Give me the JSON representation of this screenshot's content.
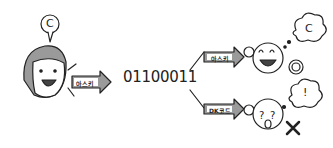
{
  "sender": {
    "thought": "C",
    "arrow_label": "아스키"
  },
  "binary": "01100011",
  "branches": [
    {
      "arrow_label": "아스키",
      "thought": "C",
      "result": "O"
    },
    {
      "arrow_label": "DK코드",
      "thought": "!",
      "result": "X"
    }
  ]
}
